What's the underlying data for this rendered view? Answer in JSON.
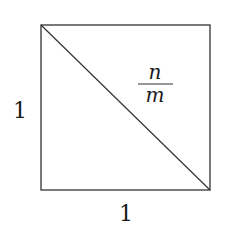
{
  "diagram": {
    "type": "unit-square-with-diagonal",
    "left_side_label": "1",
    "bottom_side_label": "1",
    "fraction": {
      "numerator": "n",
      "denominator": "m"
    },
    "stroke_color": "#333333",
    "background": "#ffffff"
  }
}
